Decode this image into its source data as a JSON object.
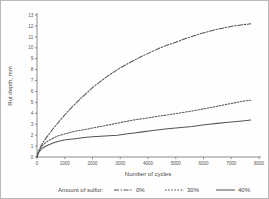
{
  "figure": {
    "background_color": "#fefefe",
    "border_color": "#b9b9b9",
    "ink_color": "#555555"
  },
  "chart_data": {
    "type": "line",
    "title": "",
    "xlabel": "Number of cycles",
    "ylabel": "Rut depth, mm",
    "xlim": [
      0,
      8000
    ],
    "ylim": [
      0,
      13
    ],
    "xticks": [
      0,
      1000,
      2000,
      3000,
      4000,
      5000,
      6000,
      7000,
      8000
    ],
    "xtick_labels": [
      "0",
      "1000",
      "2000",
      "3000",
      "4000",
      "5000",
      "6000",
      "7000",
      "8000"
    ],
    "yticks": [
      0,
      1,
      2,
      3,
      4,
      5,
      6,
      7,
      8,
      9,
      10,
      11,
      12,
      13
    ],
    "ytick_labels": [
      "0",
      "1",
      "2",
      "3",
      "4",
      "5",
      "6",
      "7",
      "8",
      "9",
      "10",
      "11",
      "12",
      "13"
    ],
    "grid": false,
    "legend_position": "below",
    "legend_title": "Amount of sulfur:",
    "series": [
      {
        "name": "0%",
        "label": "0%",
        "linestyle": "dash-dot",
        "dasharray": "5,1.6,1.4,1.6",
        "color": "#555555",
        "x": [
          0,
          60,
          130,
          220,
          330,
          450,
          600,
          780,
          980,
          1200,
          1450,
          1700,
          2000,
          2300,
          2600,
          2900,
          3200,
          3500,
          3800,
          4100,
          4400,
          4700,
          5000,
          5300,
          5600,
          5900,
          6200,
          6500,
          6800,
          7100,
          7400,
          7700
        ],
        "y": [
          0.0,
          0.55,
          0.95,
          1.35,
          1.75,
          2.15,
          2.65,
          3.2,
          3.8,
          4.4,
          5.05,
          5.65,
          6.35,
          6.95,
          7.5,
          8.0,
          8.45,
          8.85,
          9.25,
          9.6,
          9.95,
          10.25,
          10.5,
          10.8,
          11.05,
          11.3,
          11.5,
          11.7,
          11.85,
          12.0,
          12.1,
          12.2
        ]
      },
      {
        "name": "30%",
        "label": "30%",
        "linestyle": "dotted",
        "dasharray": "1.6,1.5",
        "color": "#555555",
        "x": [
          0,
          60,
          130,
          220,
          330,
          450,
          600,
          780,
          980,
          1200,
          1450,
          1700,
          2000,
          2300,
          2600,
          2900,
          3200,
          3500,
          3800,
          4100,
          4400,
          4700,
          5000,
          5300,
          5600,
          5900,
          6200,
          6500,
          6800,
          7100,
          7400,
          7700
        ],
        "y": [
          0.0,
          0.5,
          0.85,
          1.1,
          1.35,
          1.55,
          1.75,
          1.95,
          2.1,
          2.25,
          2.4,
          2.5,
          2.65,
          2.8,
          2.95,
          3.1,
          3.25,
          3.4,
          3.5,
          3.62,
          3.75,
          3.85,
          3.98,
          4.1,
          4.22,
          4.35,
          4.5,
          4.65,
          4.8,
          4.95,
          5.1,
          5.2
        ]
      },
      {
        "name": "40%",
        "label": "40%",
        "linestyle": "solid",
        "dasharray": "",
        "color": "#555555",
        "x": [
          0,
          60,
          130,
          220,
          330,
          450,
          600,
          780,
          980,
          1200,
          1450,
          1700,
          2000,
          2300,
          2600,
          2900,
          3200,
          3500,
          3800,
          4100,
          4400,
          4700,
          5000,
          5300,
          5600,
          5900,
          6200,
          6500,
          6800,
          7100,
          7400,
          7700
        ],
        "y": [
          0.0,
          0.4,
          0.65,
          0.85,
          1.0,
          1.15,
          1.3,
          1.45,
          1.55,
          1.62,
          1.7,
          1.78,
          1.85,
          1.9,
          1.95,
          2.0,
          2.1,
          2.2,
          2.3,
          2.4,
          2.5,
          2.58,
          2.65,
          2.72,
          2.8,
          2.9,
          3.0,
          3.08,
          3.15,
          3.22,
          3.3,
          3.38
        ]
      }
    ]
  }
}
